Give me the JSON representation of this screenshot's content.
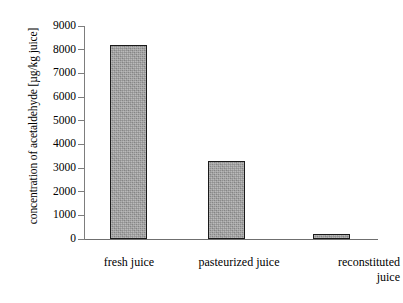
{
  "chart_data": {
    "type": "bar",
    "title": "",
    "subtitle": "",
    "xlabel": "",
    "ylabel": "concentration of acetaldehyde [µg/kg juice]",
    "categories": [
      "fresh juice",
      "pasteurized juice",
      "reconstituted\njuice"
    ],
    "values": [
      8200,
      3280,
      200
    ],
    "ylim": [
      0,
      9000
    ],
    "ytick_labels": [
      "9000",
      "8000",
      "7000",
      "6000",
      "5000",
      "4000",
      "3000",
      "2000",
      "1000",
      "0"
    ],
    "ytick_values": [
      9000,
      8000,
      7000,
      6000,
      5000,
      4000,
      3000,
      2000,
      1000,
      0
    ],
    "grid": false,
    "legend": null,
    "series": [
      {
        "name": "concentration of acetaldehyde",
        "values": [
          8200,
          3280,
          200
        ]
      }
    ],
    "colors": {
      "bar_fill": "#9b9b9b",
      "bar_border": "#1a1a1a",
      "axis": "#7d7d7d",
      "text": "#000000",
      "background": "#ffffff"
    }
  }
}
